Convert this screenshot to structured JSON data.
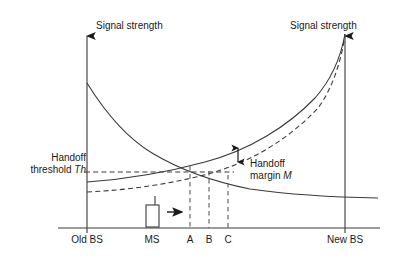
{
  "figure": {
    "title_left": "Signal strength",
    "title_right": "Signal strength",
    "threshold_label_line1": "Handoff",
    "threshold_label_line2": "threshold ",
    "threshold_symbol": "Th",
    "margin_label_line1": "Handoff",
    "margin_label_line2": "margin ",
    "margin_symbol": "M",
    "colors": {
      "line": "#3a3a3a",
      "text": "#1a1a1a",
      "background": "#ffffff"
    }
  },
  "chart_data": {
    "type": "line",
    "xlabel": "",
    "ylabel": "Signal strength",
    "grid": false,
    "legend": "none",
    "x_axis": {
      "ticks": [
        {
          "label": "Old BS",
          "x": 87
        },
        {
          "label": "MS",
          "x": 152
        },
        {
          "label": "A",
          "x": 190
        },
        {
          "label": "B",
          "x": 209
        },
        {
          "label": "C",
          "x": 228
        },
        {
          "label": "New BS",
          "x": 345
        }
      ]
    },
    "series": [
      {
        "name": "Old BS signal (actual)",
        "style": "solid",
        "description": "Monotonically decaying from Old BS toward New BS",
        "points": [
          {
            "x": 87,
            "y": 83
          },
          {
            "x": 100,
            "y": 96
          },
          {
            "x": 115,
            "y": 112
          },
          {
            "x": 132,
            "y": 128
          },
          {
            "x": 152,
            "y": 144
          },
          {
            "x": 172,
            "y": 157
          },
          {
            "x": 190,
            "y": 166
          },
          {
            "x": 209,
            "y": 173
          },
          {
            "x": 228,
            "y": 179
          },
          {
            "x": 255,
            "y": 186
          },
          {
            "x": 285,
            "y": 191
          },
          {
            "x": 315,
            "y": 195
          },
          {
            "x": 345,
            "y": 197
          },
          {
            "x": 368,
            "y": 198
          }
        ]
      },
      {
        "name": "New BS signal (actual)",
        "style": "solid",
        "description": "Monotonically rising from Old BS toward New BS",
        "points": [
          {
            "x": 87,
            "y": 182
          },
          {
            "x": 120,
            "y": 179
          },
          {
            "x": 152,
            "y": 175
          },
          {
            "x": 172,
            "y": 171
          },
          {
            "x": 190,
            "y": 166
          },
          {
            "x": 209,
            "y": 160
          },
          {
            "x": 228,
            "y": 153
          },
          {
            "x": 250,
            "y": 144
          },
          {
            "x": 275,
            "y": 130
          },
          {
            "x": 300,
            "y": 112
          },
          {
            "x": 320,
            "y": 92
          },
          {
            "x": 335,
            "y": 68
          },
          {
            "x": 343,
            "y": 45
          },
          {
            "x": 345,
            "y": 34
          }
        ]
      },
      {
        "name": "New BS signal (averaged)",
        "style": "dashed",
        "description": "Smoothed/averaged rising curve lagging the actual New BS curve",
        "points": [
          {
            "x": 87,
            "y": 192
          },
          {
            "x": 120,
            "y": 190
          },
          {
            "x": 152,
            "y": 187
          },
          {
            "x": 175,
            "y": 183
          },
          {
            "x": 195,
            "y": 178
          },
          {
            "x": 215,
            "y": 172
          },
          {
            "x": 235,
            "y": 165
          },
          {
            "x": 258,
            "y": 155
          },
          {
            "x": 280,
            "y": 142
          },
          {
            "x": 303,
            "y": 124
          },
          {
            "x": 322,
            "y": 101
          },
          {
            "x": 336,
            "y": 72
          },
          {
            "x": 343,
            "y": 48
          },
          {
            "x": 345,
            "y": 34
          }
        ]
      }
    ],
    "threshold_line": {
      "label": "Handoff threshold Th",
      "style": "dashed",
      "y": 172,
      "x_start": 85,
      "x_end": 232
    },
    "annotations": [
      {
        "name": "handoff-margin",
        "label": "Handoff margin M",
        "style": "double-arrow",
        "x": 238,
        "y_top": 147,
        "y_bottom": 163
      },
      {
        "name": "ms-mobile-station",
        "label": "MS",
        "description": "Mobile station icon with antenna moving right",
        "x": 146,
        "y": 205
      },
      {
        "name": "direction-arrow",
        "description": "Arrow indicating MS movement toward New BS",
        "x_start": 168,
        "x_end": 184,
        "y": 212
      }
    ],
    "drop_lines": [
      {
        "label": "A",
        "x": 190,
        "y_top": 166,
        "y_bottom": 228
      },
      {
        "label": "B",
        "x": 209,
        "y_top": 172,
        "y_bottom": 228
      },
      {
        "label": "C",
        "x": 228,
        "y_top": 176,
        "y_bottom": 228
      }
    ]
  }
}
